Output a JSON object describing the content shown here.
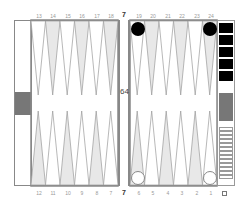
{
  "game": "Backgammon",
  "top_point_labels": [
    "13",
    "14",
    "15",
    "16",
    "17",
    "18",
    "19",
    "20",
    "21",
    "22",
    "23",
    "24"
  ],
  "bottom_point_labels": [
    "12",
    "11",
    "10",
    "9",
    "8",
    "7",
    "6",
    "5",
    "4",
    "3",
    "2",
    "1"
  ],
  "bar_label_top": "7",
  "bar_label_bottom": "7",
  "cube_value": "64",
  "tray_bottom_label": "O",
  "checkers": [
    {
      "point": "19",
      "color": "black",
      "count": 1
    },
    {
      "point": "24",
      "color": "black",
      "count": 1
    },
    {
      "point": "6",
      "color": "white",
      "count": 1
    },
    {
      "point": "1",
      "color": "white",
      "count": 1
    }
  ],
  "borne_off": {
    "black": 5,
    "white": 13
  },
  "colors": {
    "frame": "#888888",
    "point_shaded": "#e8e8e8",
    "point_light": "#ffffff",
    "black_checker": "#000000",
    "white_checker": "#ffffff",
    "bar_block": "#777777"
  }
}
